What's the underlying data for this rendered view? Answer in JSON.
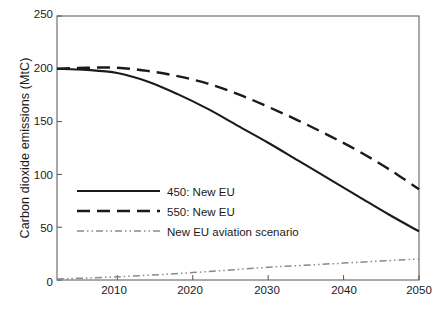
{
  "chart_data": {
    "type": "line",
    "title": "",
    "xlabel": "Year",
    "ylabel": "Carbon dioxide emissions (MtC)",
    "xlim": [
      2002,
      2050
    ],
    "ylim": [
      0,
      250
    ],
    "xticks": [
      2010,
      2020,
      2030,
      2040,
      2050
    ],
    "yticks": [
      0,
      50,
      100,
      150,
      200,
      250
    ],
    "grid": false,
    "legend_position": "center-left",
    "series": [
      {
        "name": "450: New EU",
        "style": "solid",
        "color": "#1a1a1a",
        "x": [
          2002,
          2006,
          2010,
          2014,
          2018,
          2022,
          2026,
          2030,
          2034,
          2038,
          2042,
          2046,
          2050
        ],
        "values": [
          200,
          199,
          196,
          188,
          176,
          162,
          146,
          130,
          113,
          96,
          79,
          62,
          46
        ]
      },
      {
        "name": "550: New EU",
        "style": "dashed",
        "color": "#1a1a1a",
        "x": [
          2002,
          2006,
          2010,
          2014,
          2018,
          2022,
          2026,
          2030,
          2034,
          2038,
          2042,
          2046,
          2050
        ],
        "values": [
          200,
          201,
          201,
          198,
          193,
          186,
          176,
          164,
          151,
          137,
          122,
          105,
          86
        ]
      },
      {
        "name": "New EU aviation scenario",
        "style": "dash-dot-dot",
        "color": "#8a8a8a",
        "x": [
          2002,
          2010,
          2020,
          2030,
          2040,
          2050
        ],
        "values": [
          1,
          3,
          7,
          12,
          16,
          20
        ]
      }
    ]
  },
  "axis": {
    "ylabel": "Carbon dioxide emissions (MtC)",
    "xlabel": "Year",
    "ytick_labels": [
      "250",
      "200",
      "150",
      "100",
      "50",
      "0"
    ],
    "xtick_labels": [
      "2010",
      "2020",
      "2030",
      "2040",
      "2050"
    ]
  },
  "legend": {
    "items": [
      {
        "label": "450: New EU"
      },
      {
        "label": "550: New EU"
      },
      {
        "label": "New EU aviation scenario"
      }
    ]
  }
}
